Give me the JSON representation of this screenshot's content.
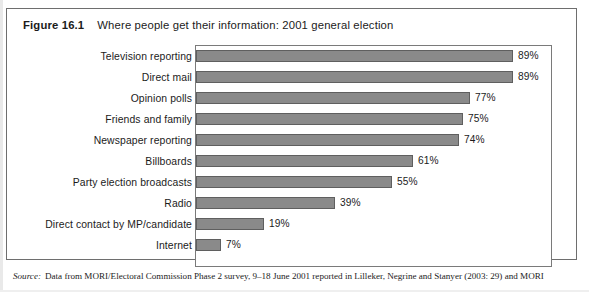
{
  "figure": {
    "number": "Figure 16.1",
    "title": "Where people get their information: 2001 general election"
  },
  "source": {
    "label": "Source:",
    "text": "Data from MORI/Electoral Commission Phase 2 survey, 9–18 June 2001 reported in Lilleker, Negrine and Stanyer (2003: 29) and MORI"
  },
  "style": {
    "bar_fill": "#8a8a8a",
    "bar_stroke": "#5f5f5f",
    "frame_stroke": "#7a7a7a",
    "box_stroke": "#6e6e6e",
    "text_color": "#1b1b1b"
  },
  "chart_data": {
    "type": "bar",
    "orientation": "horizontal",
    "title": "Where people get their information: 2001 general election",
    "xlabel": "",
    "ylabel": "",
    "xlim": [
      0,
      100
    ],
    "grid": false,
    "legend": false,
    "axis_tick_labels": [],
    "value_suffix": "%",
    "categories": [
      "Television reporting",
      "Direct mail",
      "Opinion polls",
      "Friends and family",
      "Newspaper reporting",
      "Billboards",
      "Party election broadcasts",
      "Radio",
      "Direct contact by MP/candidate",
      "Internet"
    ],
    "values": [
      89,
      89,
      77,
      75,
      74,
      61,
      55,
      39,
      19,
      7
    ],
    "data_labels": [
      "89%",
      "89%",
      "77%",
      "75%",
      "74%",
      "61%",
      "55%",
      "39%",
      "19%",
      "7%"
    ]
  }
}
